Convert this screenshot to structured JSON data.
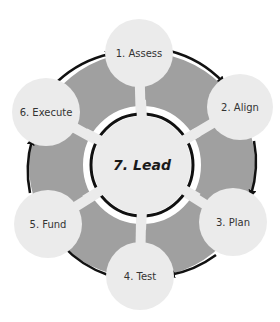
{
  "diagram": {
    "type": "cycle",
    "center": {
      "label": "7. Lead"
    },
    "nodes": [
      {
        "label": "1. Assess"
      },
      {
        "label": "2. Align"
      },
      {
        "label": "3. Plan"
      },
      {
        "label": "4. Test"
      },
      {
        "label": "5. Fund"
      },
      {
        "label": "6. Execute"
      }
    ],
    "flow": "clockwise",
    "colors": {
      "ring": "#a0a0a0",
      "node": "#ebebeb",
      "arrow": "#111111",
      "background": "#ffffff"
    }
  }
}
